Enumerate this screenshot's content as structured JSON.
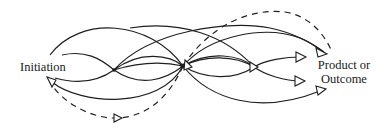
{
  "diagram": {
    "type": "process-flow",
    "start_label": "Initiation",
    "end_label_line1": "Product or",
    "end_label_line2": "Outcome",
    "nodes": [
      {
        "id": "initiation",
        "label": "Initiation"
      },
      {
        "id": "junction-1",
        "label": ""
      },
      {
        "id": "junction-2",
        "label": ""
      },
      {
        "id": "junction-3",
        "label": ""
      },
      {
        "id": "product-or-outcome",
        "label": "Product or Outcome"
      }
    ],
    "edges": [
      {
        "from": "initiation",
        "to": "junction-1",
        "style": "solid"
      },
      {
        "from": "initiation",
        "to": "junction-2",
        "style": "solid"
      },
      {
        "from": "junction-1",
        "to": "junction-2",
        "style": "solid"
      },
      {
        "from": "junction-1",
        "to": "junction-3",
        "style": "solid"
      },
      {
        "from": "junction-2",
        "to": "junction-3",
        "style": "solid"
      },
      {
        "from": "junction-2",
        "to": "product-or-outcome",
        "style": "solid"
      },
      {
        "from": "junction-3",
        "to": "product-or-outcome",
        "style": "solid"
      },
      {
        "from": "junction-2",
        "to": "product-or-outcome",
        "style": "dashed",
        "note": "upper feedback arc"
      },
      {
        "from": "junction-2",
        "to": "initiation",
        "style": "dashed",
        "note": "lower feedback arc"
      }
    ],
    "colors": {
      "stroke": "#1e1e1e",
      "background": "#ffffff"
    }
  }
}
